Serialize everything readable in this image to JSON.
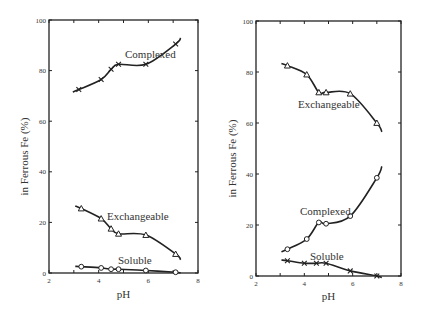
{
  "chart_data": [
    {
      "type": "line",
      "panel": "left",
      "title": "",
      "xlabel": "pH",
      "ylabel": "in Ferrous Fe (%)",
      "xlim": [
        2,
        8
      ],
      "ylim": [
        0,
        100
      ],
      "xticks": [
        2,
        4,
        6,
        8
      ],
      "yticks": [
        0,
        20,
        40,
        60,
        80,
        100
      ],
      "grid": false,
      "series": [
        {
          "name": "Complexed",
          "marker": "x",
          "x": [
            3.2,
            4.1,
            4.5,
            4.8,
            5.9,
            7.1
          ],
          "y": [
            72.5,
            76.5,
            80.5,
            82.5,
            82.5,
            90.5
          ]
        },
        {
          "name": "Exchangeable",
          "marker": "triangle",
          "x": [
            3.3,
            4.1,
            4.5,
            4.8,
            5.9,
            7.1
          ],
          "y": [
            25.5,
            21.5,
            17.5,
            15.5,
            15,
            7.5
          ]
        },
        {
          "name": "Soluble",
          "marker": "circle",
          "x": [
            3.3,
            4.1,
            4.5,
            4.8,
            5.9,
            7.1
          ],
          "y": [
            2.5,
            2,
            1.5,
            1.5,
            1,
            0.3
          ]
        }
      ]
    },
    {
      "type": "line",
      "panel": "right",
      "title": "",
      "xlabel": "pH",
      "ylabel": "in Ferrous Fe (%)",
      "xlim": [
        2,
        8
      ],
      "ylim": [
        0,
        100
      ],
      "xticks": [
        2,
        4,
        6,
        8
      ],
      "yticks": [
        0,
        20,
        40,
        60,
        80,
        100
      ],
      "grid": false,
      "series": [
        {
          "name": "Exchangeable",
          "marker": "triangle",
          "x": [
            3.3,
            4.1,
            4.6,
            4.9,
            5.9,
            7.0
          ],
          "y": [
            82.5,
            79,
            72,
            72,
            71.5,
            60
          ]
        },
        {
          "name": "Complexed",
          "marker": "circle",
          "x": [
            3.3,
            4.1,
            4.6,
            4.9,
            5.9,
            7.0
          ],
          "y": [
            10.5,
            14.5,
            21,
            20.5,
            23.5,
            38.5
          ]
        },
        {
          "name": "Soluble",
          "marker": "x",
          "x": [
            3.3,
            4.0,
            4.5,
            4.9,
            5.9,
            7.0
          ],
          "y": [
            6,
            5,
            5,
            5,
            2,
            0
          ]
        }
      ]
    }
  ],
  "labels": {
    "left": {
      "xlabel": "pH",
      "ylabel": "in Ferrous Fe (%)",
      "complexed": "Complexed",
      "exchangeable": "Exchangeable",
      "soluble": "Soluble"
    },
    "right": {
      "xlabel": "pH",
      "ylabel": "in Ferrous Fe (%)",
      "complexed": "Complexed",
      "exchangeable": "Exchangeable",
      "soluble": "Soluble"
    },
    "xtick": [
      "2",
      "4",
      "6",
      "8"
    ],
    "ytick": [
      "0",
      "20",
      "40",
      "60",
      "80",
      "100"
    ]
  }
}
